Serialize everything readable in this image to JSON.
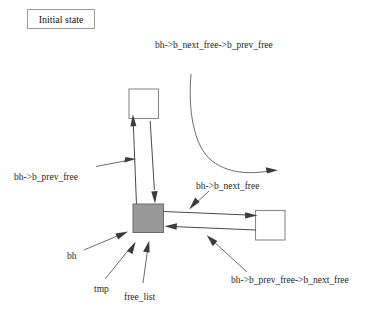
{
  "figure": {
    "title_box": {
      "label": "Initial state"
    },
    "nodes": [
      {
        "id": "top-buffer",
        "name": "top-buffer-node",
        "fill": "#ffffff"
      },
      {
        "id": "current-buffer",
        "name": "current-buffer-node",
        "fill": "#999999"
      },
      {
        "id": "right-buffer",
        "name": "right-buffer-node",
        "fill": "#ffffff"
      }
    ],
    "labels": {
      "next_prev": "bh->b_next_free->b_prev_free",
      "prev": "bh->b_prev_free",
      "next": "bh->b_next_free",
      "bh": "bh",
      "tmp": "tmp",
      "free_list": "free_list",
      "prev_next": "bh->b_prev_free->b_next_free"
    },
    "colors": {
      "highlight_fill": "#999999",
      "node_stroke": "#8a8a8a",
      "line": "#4a4a4a",
      "background": "#ffffff"
    }
  }
}
